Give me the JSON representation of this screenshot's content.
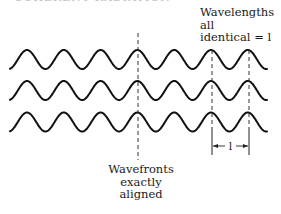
{
  "figure": {
    "top_cutoff_text": "COHERENT RADIATION",
    "wavelength_label": {
      "lines": [
        "Wavelengths",
        "all",
        "identical = l"
      ]
    },
    "wavefront_label": {
      "lines": [
        "Wavefronts",
        "exactly",
        "aligned"
      ]
    },
    "dimension_label": "l",
    "waves": {
      "count": 3,
      "period_px": 36.8,
      "amplitude_px": 9.5,
      "centerlines_y": [
        59.5,
        90.5,
        122
      ],
      "x_start": 10,
      "x_end": 267,
      "stroke_color": "#111111"
    },
    "markers": {
      "wavefront_dashed_x": 138,
      "wavelength_lines_x": [
        212,
        249
      ],
      "line_color": "#333333"
    }
  }
}
